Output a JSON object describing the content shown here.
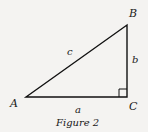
{
  "figure": {
    "caption": "Figure 2",
    "vertices": [
      {
        "name": "A",
        "label": "A"
      },
      {
        "name": "B",
        "label": "B"
      },
      {
        "name": "C",
        "label": "C"
      }
    ],
    "sides": [
      {
        "name": "a",
        "label": "a",
        "between": "A-C"
      },
      {
        "name": "b",
        "label": "b",
        "between": "B-C"
      },
      {
        "name": "c",
        "label": "c",
        "between": "A-B"
      }
    ],
    "right_angle_at": "C",
    "colors": {
      "line": "#111111",
      "background": "#f4f3f1"
    }
  }
}
